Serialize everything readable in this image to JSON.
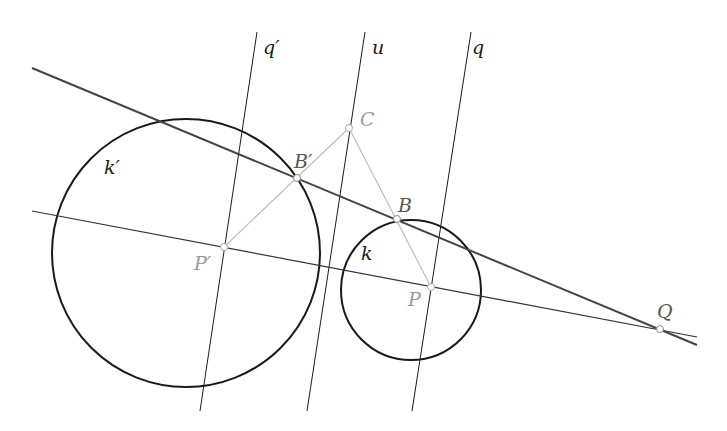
{
  "diagram": {
    "type": "geometric-construction",
    "colors": {
      "line_dark": "#1a1a1a",
      "line_tangent": "#444444",
      "construction_gray": "#bdbdbd",
      "label_gray": "#9a9a9a",
      "point_fill": "#ffffff",
      "point_stroke": "#999999"
    },
    "circles": [
      {
        "id": "k_prime",
        "label": "k′",
        "cx": 186,
        "cy": 253,
        "r": 134
      },
      {
        "id": "k",
        "label": "k",
        "cx": 411,
        "cy": 290,
        "r": 70
      }
    ],
    "lines": [
      {
        "id": "q_prime",
        "label": "q′",
        "x1": 257,
        "y1": 32,
        "x2": 200,
        "y2": 411
      },
      {
        "id": "u",
        "label": "u",
        "x1": 365,
        "y1": 32,
        "x2": 307,
        "y2": 411
      },
      {
        "id": "q",
        "label": "q",
        "x1": 471,
        "y1": 32,
        "x2": 412,
        "y2": 411
      },
      {
        "id": "tangent",
        "label": "",
        "x1": 32,
        "y1": 68,
        "x2": 697,
        "y2": 345
      },
      {
        "id": "center_line",
        "label": "",
        "x1": 32,
        "y1": 211,
        "x2": 697,
        "y2": 337
      }
    ],
    "construction_segments": [
      {
        "from": "P_prime",
        "to": "C"
      },
      {
        "from": "C",
        "to": "P"
      }
    ],
    "points": {
      "P_prime": {
        "label": "P′",
        "x": 224,
        "y": 247
      },
      "P": {
        "label": "P",
        "x": 431,
        "y": 287
      },
      "B_prime": {
        "label": "B′",
        "x": 297,
        "y": 178
      },
      "B": {
        "label": "B",
        "x": 397,
        "y": 219
      },
      "C": {
        "label": "C",
        "x": 349,
        "y": 128
      },
      "Q": {
        "label": "Q",
        "x": 660,
        "y": 329
      }
    },
    "labels": {
      "q_prime": "q′",
      "u": "u",
      "q": "q",
      "k_prime": "k′",
      "k": "k",
      "B_prime": "B′",
      "B": "B",
      "C": "C",
      "P_prime": "P′",
      "P": "P",
      "Q": "Q"
    }
  }
}
